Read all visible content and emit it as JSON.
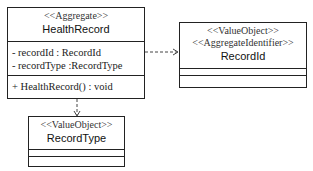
{
  "classes": {
    "health_record": {
      "stereotypes": [
        "<<Aggregate>>"
      ],
      "name": "HealthRecord",
      "attributes": [
        "- recordId : RecordId",
        "- recordType :RecordType"
      ],
      "operations": [
        "+ HealthRecord() : void"
      ]
    },
    "record_id": {
      "stereotypes": [
        "<<ValueObject>>",
        "<<AggregateIdentifier>>"
      ],
      "name": "RecordId",
      "attributes": [],
      "operations": []
    },
    "record_type": {
      "stereotypes": [
        "<<ValueObject>>"
      ],
      "name": "RecordType",
      "attributes": [],
      "operations": []
    }
  },
  "relations": [
    {
      "from": "HealthRecord",
      "to": "RecordId",
      "type": "dependency"
    },
    {
      "from": "HealthRecord",
      "to": "RecordType",
      "type": "dependency"
    }
  ]
}
